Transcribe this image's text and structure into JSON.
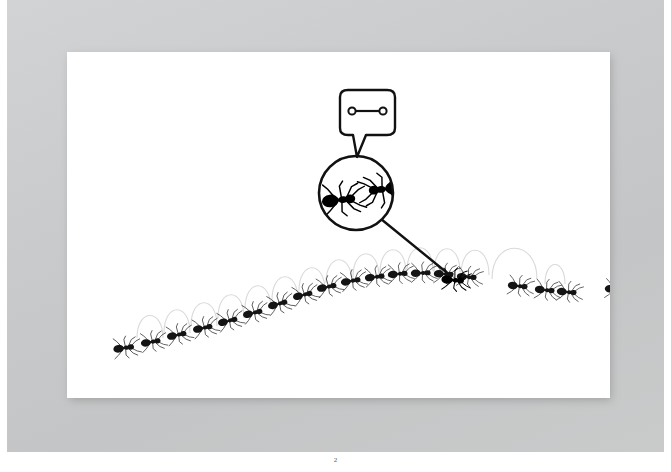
{
  "document": {
    "page_number": "2",
    "background_color": "#c8c9ca",
    "page_color": "#ffffff",
    "page_shadow_color": "#5a5c5f"
  },
  "illustration": {
    "title": "Ant trail with magnifying glass and speech bubble",
    "ink_color": "#111111",
    "trail_arc_color": "#d8d8d8",
    "ant_body_color": "#1a1a1a",
    "magnifier": {
      "name": "magnifying-glass",
      "center_x": 289,
      "center_y": 141,
      "radius": 39,
      "handle_from_x": 316,
      "handle_from_y": 169,
      "handle_to_x": 382,
      "handle_to_y": 221,
      "ants_inside": [
        {
          "label": "left-ant-inside-lens",
          "x": 268,
          "y": 145,
          "facing": "right"
        },
        {
          "label": "right-ant-inside-lens",
          "x": 312,
          "y": 138,
          "facing": "left"
        }
      ]
    },
    "speech_bubble": {
      "name": "speech-bubble",
      "x": 336,
      "y": 42,
      "width": 56,
      "height": 48,
      "symbol": "dumbbell-symbol",
      "symbol_description": "horizontal bar with an open circle at each end"
    },
    "trail": {
      "arc_count": 14,
      "ant_count": 20,
      "arcs": [
        {
          "cx": 83,
          "cy": 286,
          "rx": 13,
          "ry": 30
        },
        {
          "cx": 110,
          "cy": 281,
          "rx": 13,
          "ry": 31
        },
        {
          "cx": 137,
          "cy": 274,
          "rx": 13,
          "ry": 31
        },
        {
          "cx": 164,
          "cy": 266,
          "rx": 13,
          "ry": 31
        },
        {
          "cx": 191,
          "cy": 256,
          "rx": 13,
          "ry": 31
        },
        {
          "cx": 218,
          "cy": 246,
          "rx": 13,
          "ry": 31
        },
        {
          "cx": 245,
          "cy": 236,
          "rx": 13,
          "ry": 31
        },
        {
          "cx": 272,
          "cy": 228,
          "rx": 13,
          "ry": 31
        },
        {
          "cx": 299,
          "cy": 222,
          "rx": 13,
          "ry": 31
        },
        {
          "cx": 326,
          "cy": 218,
          "rx": 13,
          "ry": 31
        },
        {
          "cx": 353,
          "cy": 217,
          "rx": 13,
          "ry": 31
        },
        {
          "cx": 380,
          "cy": 219,
          "rx": 13,
          "ry": 31
        },
        {
          "cx": 412,
          "cy": 222,
          "rx": 17,
          "ry": 34
        },
        {
          "cx": 455,
          "cy": 228,
          "rx": 17,
          "ry": 32
        }
      ],
      "ants": [
        {
          "x": 57,
          "y": 296,
          "scale": 1.05,
          "rot": -8
        },
        {
          "x": 84,
          "y": 290,
          "scale": 1.0,
          "rot": -10
        },
        {
          "x": 110,
          "y": 283,
          "scale": 1.0,
          "rot": -12
        },
        {
          "x": 136,
          "y": 276,
          "scale": 1.0,
          "rot": -12
        },
        {
          "x": 161,
          "y": 269,
          "scale": 1.0,
          "rot": -14
        },
        {
          "x": 186,
          "y": 261,
          "scale": 1.0,
          "rot": -14
        },
        {
          "x": 211,
          "y": 252,
          "scale": 1.0,
          "rot": -15
        },
        {
          "x": 236,
          "y": 243,
          "scale": 1.0,
          "rot": -14
        },
        {
          "x": 260,
          "y": 235,
          "scale": 1.0,
          "rot": -12
        },
        {
          "x": 284,
          "y": 229,
          "scale": 1.0,
          "rot": -10
        },
        {
          "x": 308,
          "y": 225,
          "scale": 1.0,
          "rot": -7
        },
        {
          "x": 331,
          "y": 222,
          "scale": 1.0,
          "rot": -5
        },
        {
          "x": 354,
          "y": 221,
          "scale": 1.0,
          "rot": -2
        },
        {
          "x": 377,
          "y": 222,
          "scale": 1.0,
          "rot": 2
        },
        {
          "x": 400,
          "y": 225,
          "scale": 1.0,
          "rot": 4
        },
        {
          "x": 425,
          "y": 229,
          "scale": 1.1,
          "rot": 5
        },
        {
          "x": 451,
          "y": 234,
          "scale": 1.0,
          "rot": 6
        },
        {
          "x": 478,
          "y": 238,
          "scale": 1.0,
          "rot": 6
        },
        {
          "x": 500,
          "y": 240,
          "scale": 1.0,
          "rot": 5
        },
        {
          "x": 548,
          "y": 237,
          "scale": 1.0,
          "rot": 3
        }
      ],
      "highlighted_ant_index": 15
    }
  }
}
